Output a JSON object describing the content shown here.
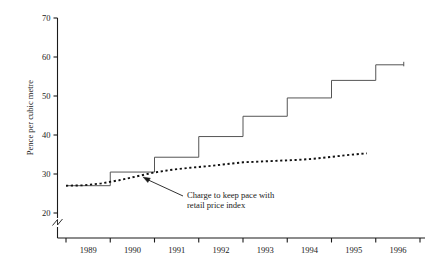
{
  "chart_data": {
    "type": "line",
    "title": "",
    "subtitle": "",
    "xlabel": "",
    "ylabel": "Pence per cubic metre",
    "xlim": [
      1988.6,
      1996.6
    ],
    "ylim": [
      17.5,
      70
    ],
    "yticks": [
      20,
      30,
      40,
      50,
      60,
      70
    ],
    "ytick_labels": [
      "20",
      "30",
      "40",
      "50",
      "60",
      "70"
    ],
    "xticks": [
      1988.6,
      1989.6,
      1990.6,
      1991.6,
      1992.6,
      1993.6,
      1994.6,
      1995.6,
      1996.6
    ],
    "xtick_labels": [
      "1989",
      "1990",
      "1991",
      "1992",
      "1993",
      "1994",
      "1995",
      "1996"
    ],
    "y_axis_break": true,
    "grid": false,
    "legend": "none",
    "series": [
      {
        "name": "Actual charge",
        "style": "step-solid",
        "x": [
          1988.6,
          1989.6,
          1990.6,
          1991.6,
          1992.6,
          1993.6,
          1994.6,
          1995.6
        ],
        "values": [
          27.0,
          30.5,
          34.3,
          39.6,
          44.8,
          49.5,
          54.0,
          58.0
        ]
      },
      {
        "name": "Charge to keep pace with retail price index",
        "style": "dotted",
        "x": [
          1988.6,
          1989.0,
          1989.4,
          1989.8,
          1990.2,
          1990.6,
          1991.0,
          1991.4,
          1991.8,
          1992.2,
          1992.6,
          1993.0,
          1993.4,
          1993.8,
          1994.2,
          1994.6,
          1995.0,
          1995.4
        ],
        "values": [
          27.0,
          27.1,
          27.6,
          28.4,
          29.4,
          30.4,
          31.1,
          31.6,
          32.0,
          32.5,
          33.0,
          33.2,
          33.4,
          33.6,
          33.9,
          34.4,
          34.9,
          35.3
        ]
      }
    ],
    "annotations": [
      {
        "name": "rpi-annotation",
        "line1": "Charge to keep pace with",
        "line2": "retail price index",
        "arrow_from_x": 183,
        "arrow_from_y": 196,
        "arrow_to_x": 143,
        "arrow_to_y": 177
      }
    ],
    "colors": {
      "axis": "#1a1a1a",
      "step_line": "#555555",
      "dotted_line": "#111111",
      "text": "#1a1a1a",
      "background": "#ffffff"
    }
  }
}
